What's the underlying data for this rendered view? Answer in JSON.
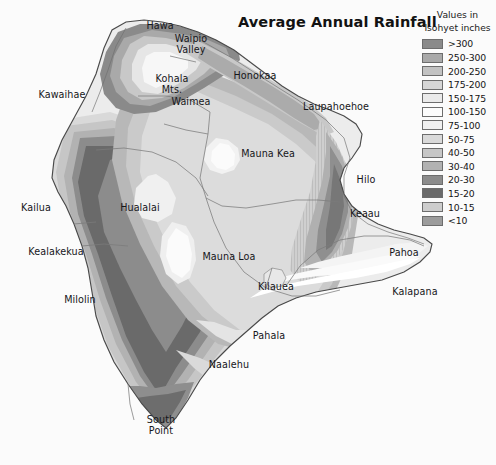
{
  "title": "Average Annual Rainfall",
  "background_color": "#fbfbfb",
  "legend": {
    "title_line1": "Values in",
    "title_line2": "Isohyet inches",
    "entries": [
      {
        "label": ">300",
        "color": "#8a8a8a"
      },
      {
        "label": "250-300",
        "color": "#a9a9a9"
      },
      {
        "label": "200-250",
        "color": "#c2c2c2"
      },
      {
        "label": "175-200",
        "color": "#d6d6d6"
      },
      {
        "label": "150-175",
        "color": "#eaeaea"
      },
      {
        "label": "100-150",
        "color": "#fcfcfc"
      },
      {
        "label": "75-100",
        "color": "#f0f0f0"
      },
      {
        "label": "50-75",
        "color": "#d9d9d9"
      },
      {
        "label": "40-50",
        "color": "#c6c6c6"
      },
      {
        "label": "30-40",
        "color": "#b2b2b2"
      },
      {
        "label": "20-30",
        "color": "#8c8c8c"
      },
      {
        "label": "15-20",
        "color": "#6a6a6a"
      },
      {
        "label": "10-15",
        "color": "#cdcdcd"
      },
      {
        "label": "<10",
        "color": "#9c9c9c"
      }
    ]
  },
  "map": {
    "island": "Hawaii",
    "outline_color": "#4a4a4a",
    "district_line_color": "#7b7b7b",
    "places": [
      {
        "name": "Hawa",
        "x": 160,
        "y": 21,
        "lines": [
          "Hawa"
        ]
      },
      {
        "name": "Waipio Valley",
        "x": 191,
        "y": 34,
        "lines": [
          "Waipio",
          "Valley"
        ]
      },
      {
        "name": "Honokaa",
        "x": 255,
        "y": 71,
        "lines": [
          "Honokaa"
        ]
      },
      {
        "name": "Kohala Mts.",
        "x": 172,
        "y": 74,
        "lines": [
          "Kohala",
          "Mts."
        ]
      },
      {
        "name": "Kawaihae",
        "x": 62,
        "y": 90,
        "lines": [
          "Kawaihae"
        ]
      },
      {
        "name": "Waimea",
        "x": 191,
        "y": 97,
        "lines": [
          "Waimea"
        ]
      },
      {
        "name": "Laupahoehoe",
        "x": 336,
        "y": 102,
        "lines": [
          "Laupahoehoe"
        ]
      },
      {
        "name": "Mauna Kea",
        "x": 268,
        "y": 149,
        "lines": [
          "Mauna Kea"
        ]
      },
      {
        "name": "Hilo",
        "x": 366,
        "y": 175,
        "lines": [
          "Hilo"
        ]
      },
      {
        "name": "Kailua",
        "x": 36,
        "y": 203,
        "lines": [
          "Kailua"
        ]
      },
      {
        "name": "Hualalai",
        "x": 140,
        "y": 203,
        "lines": [
          "Hualalai"
        ]
      },
      {
        "name": "Keaau",
        "x": 365,
        "y": 209,
        "lines": [
          "Keaau"
        ]
      },
      {
        "name": "Kealakekua",
        "x": 56,
        "y": 247,
        "lines": [
          "Kealakekua"
        ]
      },
      {
        "name": "Mauna Loa",
        "x": 229,
        "y": 252,
        "lines": [
          "Mauna Loa"
        ]
      },
      {
        "name": "Pahoa",
        "x": 404,
        "y": 248,
        "lines": [
          "Pahoa"
        ]
      },
      {
        "name": "Milolin",
        "x": 80,
        "y": 295,
        "lines": [
          "Milolin"
        ]
      },
      {
        "name": "Kilauea",
        "x": 276,
        "y": 282,
        "lines": [
          "Kilauea"
        ]
      },
      {
        "name": "Kalapana",
        "x": 415,
        "y": 287,
        "lines": [
          "Kalapana"
        ]
      },
      {
        "name": "Pahala",
        "x": 269,
        "y": 331,
        "lines": [
          "Pahala"
        ]
      },
      {
        "name": "Naalehu",
        "x": 229,
        "y": 360,
        "lines": [
          "Naalehu"
        ]
      },
      {
        "name": "South Point",
        "x": 161,
        "y": 415,
        "lines": [
          "South",
          "Point"
        ]
      }
    ]
  }
}
